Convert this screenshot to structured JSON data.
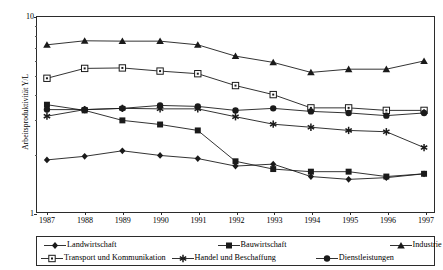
{
  "chart_data": {
    "type": "line",
    "title": "",
    "xlabel": "",
    "ylabel": "Arbeitsproduktivität Y/L",
    "categories": [
      "1987",
      "1988",
      "1989",
      "1990",
      "1991",
      "1992",
      "1993",
      "1994",
      "1995",
      "1996",
      "1997"
    ],
    "yscale": "log",
    "ylim": [
      1,
      10
    ],
    "yticks": [
      1,
      10
    ],
    "ytick_labels": [
      "1",
      "10"
    ],
    "grid": false,
    "legend_position": "bottom",
    "series": [
      {
        "name": "Landwirtschaft",
        "marker": "filled-diamond",
        "values": [
          1.85,
          1.93,
          2.06,
          1.95,
          1.88,
          1.72,
          1.76,
          1.52,
          1.47,
          1.5,
          1.57
        ]
      },
      {
        "name": "Bauwirtschaft",
        "marker": "filled-square",
        "values": [
          3.55,
          3.32,
          2.95,
          2.81,
          2.62,
          1.82,
          1.66,
          1.61,
          1.61,
          1.52,
          1.57
        ]
      },
      {
        "name": "Industrie",
        "marker": "filled-triangle",
        "values": [
          7.2,
          7.55,
          7.52,
          7.52,
          7.2,
          6.3,
          5.85,
          5.2,
          5.4,
          5.4,
          5.95
        ]
      },
      {
        "name": "Transport und Kommunikation",
        "marker": "open-square",
        "values": [
          4.85,
          5.45,
          5.48,
          5.28,
          5.12,
          4.45,
          4.0,
          3.42,
          3.42,
          3.32,
          3.32
        ]
      },
      {
        "name": "Handel und Beschaffung",
        "marker": "star",
        "values": [
          3.1,
          3.35,
          3.4,
          3.38,
          3.38,
          3.08,
          2.82,
          2.72,
          2.62,
          2.58,
          2.14
        ]
      },
      {
        "name": "Dienstleistungen",
        "marker": "filled-circle",
        "values": [
          3.35,
          3.35,
          3.4,
          3.52,
          3.48,
          3.32,
          3.4,
          3.28,
          3.22,
          3.12,
          3.22
        ]
      }
    ]
  },
  "axes": {
    "y_label": "Arbeitsproduktivität Y/L",
    "y_tick_top": "10",
    "y_tick_bottom": "1"
  },
  "legend": {
    "items": [
      {
        "label": "Landwirtschaft",
        "marker": "filled-diamond"
      },
      {
        "label": "Bauwirtschaft",
        "marker": "filled-square"
      },
      {
        "label": "Industrie",
        "marker": "filled-triangle"
      },
      {
        "label": "Transport und Kommunikation",
        "marker": "open-square"
      },
      {
        "label": "Handel und Beschaffung",
        "marker": "star"
      },
      {
        "label": "Dienstleistungen",
        "marker": "filled-circle"
      }
    ]
  },
  "colors": {
    "line": "#1a1a1a",
    "axis": "#2b2b2b",
    "background": "#ffffff"
  }
}
